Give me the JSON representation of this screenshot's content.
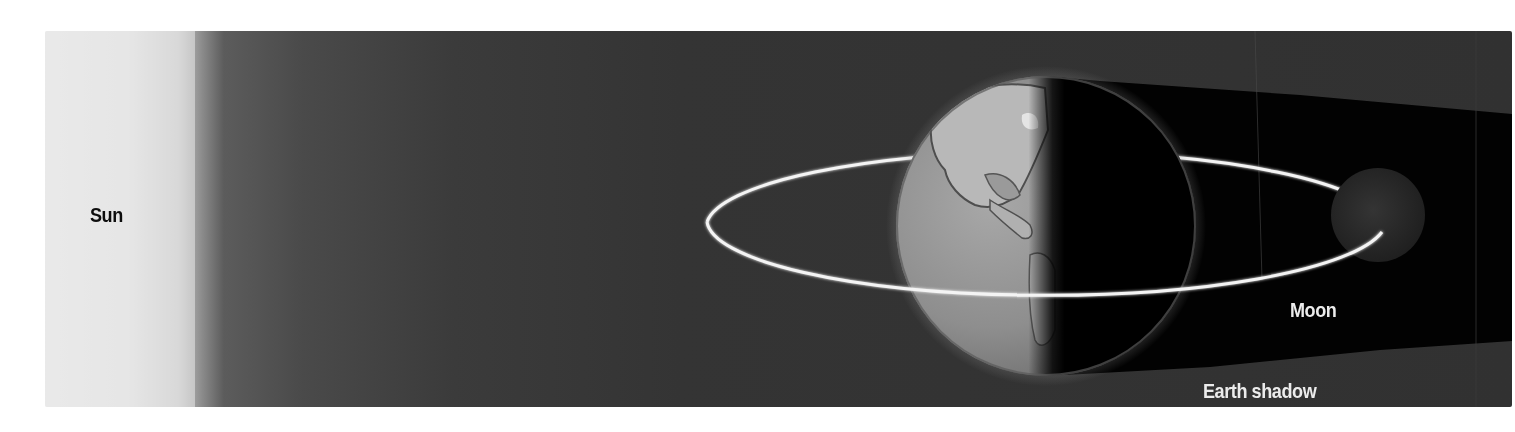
{
  "diagram": {
    "labels": {
      "sun": "Sun",
      "moon": "Moon",
      "earth_shadow": "Earth shadow"
    },
    "objects": [
      {
        "name": "Sun",
        "position": "left edge, glowing white"
      },
      {
        "name": "Earth",
        "position": "center-right, half lit (day side facing Sun)"
      },
      {
        "name": "Moon",
        "position": "inside Earth shadow on far side of orbit"
      },
      {
        "name": "Moon orbit",
        "shape": "ellipse around Earth"
      },
      {
        "name": "Earth shadow",
        "shape": "dark wedge extending away from Sun"
      }
    ],
    "colors": {
      "page_background": "#ffffff",
      "sun_white": "#ececec",
      "space": "#333333",
      "shadow": "#000000",
      "orbit": "#f4f4f4",
      "earth_day": "#8c8c8c",
      "moon": "#2a2a2a",
      "label_dark": "#0d0d0d",
      "label_light": "#ececec"
    }
  }
}
